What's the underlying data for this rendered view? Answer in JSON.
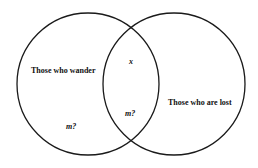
{
  "diagram": {
    "type": "venn",
    "sets": [
      {
        "id": "left",
        "label": "Those who wander",
        "region_label": "m?"
      },
      {
        "id": "right",
        "label": "Those who are lost"
      }
    ],
    "intersection": {
      "upper_label": "x",
      "lower_label": "m?"
    },
    "colors": {
      "stroke": "#1a1a1a",
      "background": "#ffffff"
    }
  }
}
